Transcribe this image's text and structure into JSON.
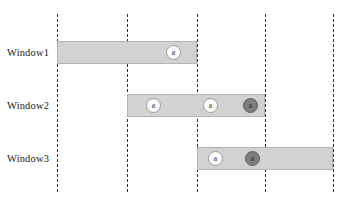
{
  "figure": {
    "type": "timeline-window-diagram",
    "width": 346,
    "height": 205,
    "background_color": "#ffffff"
  },
  "colors": {
    "bar_fill": "#d2d2d2",
    "bar_border": "#b4b4b4",
    "gridline": "#2b2b2b",
    "marker_light_fill": "#fdfdfd",
    "marker_dark_fill": "#7d7d7d",
    "marker_border": "#9a9a9a",
    "text": "#1a1a1a"
  },
  "gridlines": [
    {
      "id": "t1",
      "x": 57
    },
    {
      "id": "t2",
      "x": 127
    },
    {
      "id": "t3",
      "x": 197
    },
    {
      "id": "t4",
      "x": 265
    },
    {
      "id": "t5",
      "x": 333
    }
  ],
  "rows": [
    {
      "label": "Window1",
      "label_y": 48,
      "bar": {
        "x": 57,
        "y": 41,
        "width": 140
      },
      "markers": [
        {
          "label": "a",
          "style": "light",
          "x": 166,
          "y": 45
        }
      ]
    },
    {
      "label": "Window2",
      "label_y": 101,
      "bar": {
        "x": 127,
        "y": 94,
        "width": 138
      },
      "markers": [
        {
          "label": "a",
          "style": "light",
          "x": 146,
          "y": 98
        },
        {
          "label": "a",
          "style": "light",
          "x": 203,
          "y": 98
        },
        {
          "label": "a",
          "style": "dark",
          "x": 243,
          "y": 98
        }
      ]
    },
    {
      "label": "Window3",
      "label_y": 154,
      "bar": {
        "x": 197,
        "y": 147,
        "width": 136
      },
      "markers": [
        {
          "label": "a",
          "style": "light",
          "x": 208,
          "y": 151
        },
        {
          "label": "a",
          "style": "dark",
          "x": 245,
          "y": 151
        }
      ]
    }
  ]
}
